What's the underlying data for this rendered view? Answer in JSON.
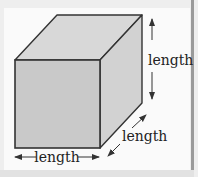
{
  "diagram": {
    "labels": {
      "height": "length",
      "depth": "length",
      "width": "length"
    },
    "colors": {
      "front_face": "#c9c9c9",
      "top_face": "#d8d8d8",
      "side_face": "#d2d2d2",
      "edge": "#333333",
      "arrow": "#333333",
      "background": "#fafafa",
      "frame_border": "#9a9a9a"
    }
  }
}
